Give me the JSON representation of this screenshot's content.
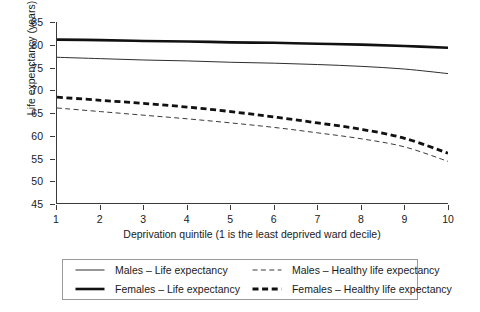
{
  "chart_data": {
    "type": "line",
    "title": "",
    "xlabel": "Deprivation quintile (1 is the least deprived ward decile)",
    "ylabel": "Life expenctancy (years)",
    "x": [
      1,
      2,
      3,
      4,
      5,
      6,
      7,
      8,
      9,
      10
    ],
    "xlim": [
      1,
      10
    ],
    "ylim": [
      45,
      85
    ],
    "y_ticks": [
      85,
      80,
      75,
      70,
      65,
      60,
      55,
      50,
      45
    ],
    "x_ticks": [
      1,
      2,
      3,
      4,
      5,
      6,
      7,
      8,
      9,
      10
    ],
    "grid": false,
    "legend_position": "below",
    "series": [
      {
        "name": "Males – Life expectancy",
        "style": "solid-thin",
        "color": "#2e2e2e",
        "values": [
          77.2,
          76.9,
          76.6,
          76.4,
          76.1,
          75.9,
          75.6,
          75.2,
          74.6,
          73.6
        ]
      },
      {
        "name": "Females – Life expectancy",
        "style": "solid-thick",
        "color": "#111111",
        "values": [
          81.1,
          81.0,
          80.8,
          80.7,
          80.5,
          80.4,
          80.2,
          80.0,
          79.7,
          79.3
        ]
      },
      {
        "name": "Males – Healthy life expectancy",
        "style": "dashed-thin",
        "color": "#3a3a3a",
        "values": [
          66.0,
          65.2,
          64.4,
          63.6,
          62.7,
          61.7,
          60.5,
          59.2,
          57.4,
          54.2
        ]
      },
      {
        "name": "Females – Healthy life expectancy",
        "style": "dashed-thick",
        "color": "#111111",
        "values": [
          68.4,
          67.7,
          67.0,
          66.2,
          65.2,
          64.0,
          62.7,
          61.3,
          59.3,
          56.0
        ]
      }
    ]
  },
  "legend": {
    "entries": [
      {
        "label": "Males – Life expectancy",
        "style": "solid-thin"
      },
      {
        "label": "Males – Healthy life expectancy",
        "style": "dashed-thin"
      },
      {
        "label": "Females – Life expectancy",
        "style": "solid-thick"
      },
      {
        "label": "Females – Healthy life expectancy",
        "style": "dashed-thick"
      }
    ]
  }
}
